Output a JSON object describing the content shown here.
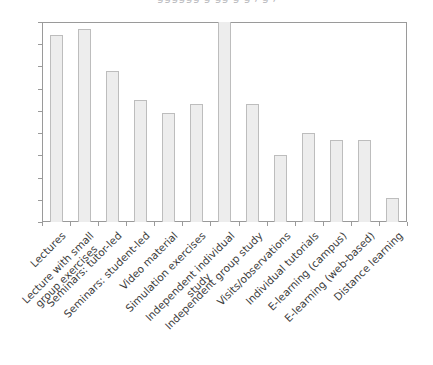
{
  "title_remnant": "gggggg  g  gg  g  g  , g  ,",
  "colors": {
    "bar_fill": "#ededed",
    "bar_border": "#bdbdbd",
    "axis": "#9a9a9a",
    "text": "#3c3c3c",
    "background": "#ffffff"
  },
  "chart_data": {
    "type": "bar",
    "title": "",
    "xlabel": "",
    "ylabel": "",
    "ylim": [
      0,
      90
    ],
    "grid": false,
    "legend": "none",
    "ytick_labels": [
      "0",
      "10",
      "20",
      "30",
      "40",
      "50",
      "60",
      "70",
      "80",
      "90"
    ],
    "ytick_values": [
      0,
      10,
      20,
      30,
      40,
      50,
      60,
      70,
      80,
      90
    ],
    "categories": [
      "Lectures",
      "Lecture with small group exercises",
      "Seminars: tutor-led",
      "Seminars: student-led",
      "Video material",
      "Simulation exercises",
      "Independent individual study",
      "Independent group study",
      "Visits/observations",
      "Individual tutorials",
      "E-learning (campus)",
      "E-learning (web-based)",
      "Distance learning"
    ],
    "values": [
      84,
      87,
      68,
      55,
      49,
      53,
      90,
      53,
      30,
      40,
      37,
      37,
      11
    ]
  },
  "x_label_lines": [
    [
      "Lectures"
    ],
    [
      "Lecture with small",
      "group exercises"
    ],
    [
      "Seminars: tutor-led"
    ],
    [
      "Seminars: student-led"
    ],
    [
      "Video material"
    ],
    [
      "Simulation exercises"
    ],
    [
      "Independent individual",
      "study"
    ],
    [
      "Independent group study"
    ],
    [
      "Visits/observations"
    ],
    [
      "Individual tutorials"
    ],
    [
      "E-learning (campus)"
    ],
    [
      "E-learning (web-based)"
    ],
    [
      "Distance learning"
    ]
  ]
}
